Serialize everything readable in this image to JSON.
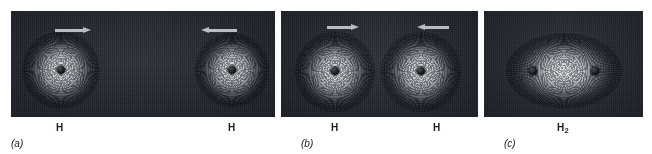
{
  "figure": {
    "background_color": "#ffffff",
    "panel_color": "#1c1f26",
    "arrow_color": "#b9bcc2",
    "label_color": "#1b1d28",
    "width": 652,
    "height": 154
  },
  "panels": [
    {
      "id": "a",
      "caption": "(a)",
      "atoms": [
        {
          "label": "H",
          "label_sub": ""
        },
        {
          "label": "H",
          "label_sub": ""
        }
      ],
      "arrows": [
        {
          "direction": "right",
          "name": "arrow-right"
        },
        {
          "direction": "left",
          "name": "arrow-left"
        }
      ],
      "description": "Two separated hydrogen atoms approaching each other"
    },
    {
      "id": "b",
      "caption": "(b)",
      "atoms": [
        {
          "label": "H",
          "label_sub": ""
        },
        {
          "label": "H",
          "label_sub": ""
        }
      ],
      "arrows": [
        {
          "direction": "right",
          "name": "arrow-right"
        },
        {
          "direction": "left",
          "name": "arrow-left"
        }
      ],
      "description": "Two hydrogen atoms in contact, electron clouds beginning to overlap"
    },
    {
      "id": "c",
      "caption": "(c)",
      "atoms": [
        {
          "label": "H",
          "label_sub": "2"
        }
      ],
      "arrows": [],
      "description": "Hydrogen molecule H2 with merged electron cloud and two nuclei"
    }
  ]
}
